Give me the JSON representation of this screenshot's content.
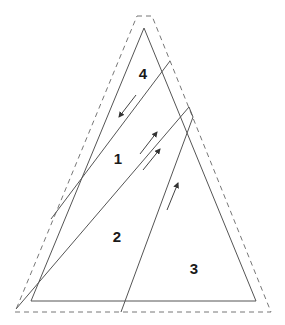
{
  "diagram": {
    "type": "triangle-region-partition",
    "colors": {
      "stroke": "#555555",
      "dashed_stroke": "#777777",
      "label": "#1a1a1a",
      "background": "#ffffff"
    },
    "outer_dashed_outline": {
      "points": [
        [
          137,
          16
        ],
        [
          152,
          16
        ],
        [
          271,
          312
        ],
        [
          15,
          312
        ]
      ],
      "style": "dashed"
    },
    "inner_triangle": {
      "points": [
        [
          144,
          28
        ],
        [
          256,
          301
        ],
        [
          31,
          301
        ]
      ],
      "style": "solid"
    },
    "cut_lines": [
      {
        "id": "cut-a",
        "from": [
          170,
          61
        ],
        "to": [
          51,
          219
        ]
      },
      {
        "id": "cut-b",
        "points": [
          [
            16,
            309
          ],
          [
            189,
            107
          ],
          [
            193,
            117
          ],
          [
            121,
            312
          ]
        ]
      }
    ],
    "arrows": [
      {
        "id": "arrow-region-4",
        "from": [
          136,
          95
        ],
        "to": [
          119,
          117
        ],
        "direction": "down-left"
      },
      {
        "id": "arrow-region-1a",
        "from": [
          140,
          154
        ],
        "to": [
          157,
          132
        ],
        "direction": "up-right"
      },
      {
        "id": "arrow-region-1b",
        "from": [
          143,
          170
        ],
        "to": [
          160,
          149
        ],
        "direction": "up-right"
      },
      {
        "id": "arrow-region-3",
        "from": [
          167,
          210
        ],
        "to": [
          178,
          183
        ],
        "direction": "up-right"
      }
    ],
    "labels": [
      {
        "id": "label-4",
        "text": "4",
        "x": 143,
        "y": 73
      },
      {
        "id": "label-1",
        "text": "1",
        "x": 118,
        "y": 158
      },
      {
        "id": "label-2",
        "text": "2",
        "x": 117,
        "y": 236
      },
      {
        "id": "label-3",
        "text": "3",
        "x": 194,
        "y": 268
      }
    ]
  }
}
